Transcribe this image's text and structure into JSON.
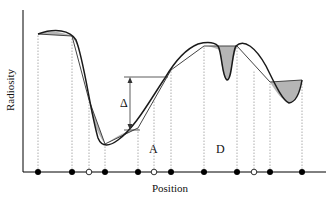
{
  "figure": {
    "ylabel": "Radiosity",
    "xlabel": "Position",
    "labels": {
      "delta": "Δ",
      "a": "A",
      "d": "D"
    },
    "colors": {
      "curve": "#1a1a1a",
      "approx": "#333333",
      "error_fill": "#b3b3b3",
      "axis": "#000000",
      "dotted": "#888888"
    }
  },
  "nodes": [
    {
      "x": 38,
      "type": "filled"
    },
    {
      "x": 72,
      "type": "filled"
    },
    {
      "x": 89,
      "type": "open"
    },
    {
      "x": 105,
      "type": "filled"
    },
    {
      "x": 138,
      "type": "filled"
    },
    {
      "x": 154,
      "type": "open"
    },
    {
      "x": 171,
      "type": "filled"
    },
    {
      "x": 204,
      "type": "filled"
    },
    {
      "x": 237,
      "type": "filled"
    },
    {
      "x": 254,
      "type": "open"
    },
    {
      "x": 270,
      "type": "filled"
    },
    {
      "x": 302,
      "type": "filled"
    }
  ]
}
